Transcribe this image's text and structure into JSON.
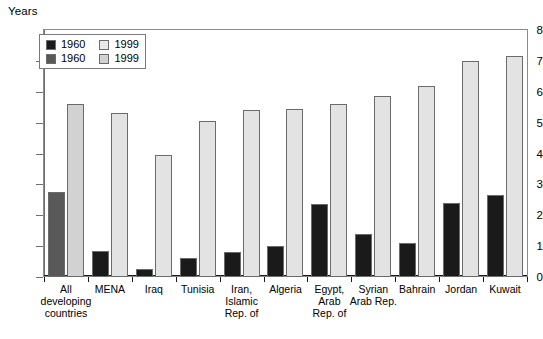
{
  "chart_data": {
    "type": "bar",
    "title": "",
    "subtitle": "",
    "xlabel": "",
    "ylabel": "Years",
    "ylim": [
      0,
      8
    ],
    "ytick_labels": [
      "8",
      "7",
      "6",
      "5",
      "4",
      "3",
      "2",
      "1",
      "0"
    ],
    "ytick_values": [
      8,
      7,
      6,
      5,
      4,
      3,
      2,
      1,
      0
    ],
    "grid": false,
    "legend_position": "top-left",
    "categories": [
      "All\ndeveloping\ncountries",
      "MENA",
      "Iraq",
      "Tunisia",
      "Iran,\nIslamic\nRep. of",
      "Algeria",
      "Egypt,\nArab\nRep. of",
      "Syrian\nArab Rep.",
      "Bahrain",
      "Jordan",
      "Kuwait"
    ],
    "series": [
      {
        "name": "1960",
        "values": [
          2.75,
          0.85,
          0.25,
          0.6,
          0.8,
          1.0,
          2.35,
          1.4,
          1.1,
          2.4,
          2.65
        ]
      },
      {
        "name": "1999",
        "values": [
          5.6,
          5.3,
          3.95,
          5.05,
          5.4,
          5.45,
          5.6,
          5.85,
          6.2,
          7.0,
          7.15
        ]
      }
    ],
    "highlight_first_group": true,
    "colors": {
      "series_1960_dark": "#1a1a1a",
      "series_1960_gray": "#595959",
      "series_1999_light": "#e3e3e3",
      "series_1999_gray": "#d2d2d2",
      "bar_border": "#6b6b6b",
      "axis": "#1a1a1a",
      "frame": "#8c8c8c",
      "background": "#ffffff",
      "text": "#000000"
    }
  },
  "legend": {
    "rows": [
      {
        "left_label": "1960",
        "left_color": "#1a1a1a",
        "right_label": "1999",
        "right_color": "#e9e9e9"
      },
      {
        "left_label": "1960",
        "left_color": "#595959",
        "right_label": "1999",
        "right_color": "#d2d2d2"
      }
    ]
  }
}
